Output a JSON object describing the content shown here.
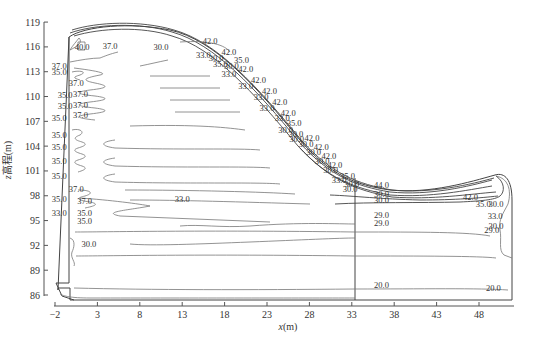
{
  "chart_data": {
    "type": "contour",
    "title": "",
    "xlabel": "x(m)",
    "ylabel": "z高程(m)",
    "xlim": [
      -2,
      51
    ],
    "ylim": [
      86,
      119
    ],
    "x_ticks": [
      "-2",
      "3",
      "8",
      "13",
      "18",
      "23",
      "28",
      "33",
      "38",
      "43",
      "48"
    ],
    "y_ticks": [
      "86",
      "89",
      "92",
      "95",
      "98",
      "101",
      "104",
      "107",
      "110",
      "113",
      "116",
      "119"
    ],
    "grid": false,
    "legend": null,
    "contour_labels": [
      {
        "x": 1.2,
        "z": 115.6,
        "value": "40.0"
      },
      {
        "x": 4.5,
        "z": 115.8,
        "value": "37.0"
      },
      {
        "x": 10.5,
        "z": 115.6,
        "value": "30.0"
      },
      {
        "x": 16.3,
        "z": 116.4,
        "value": "42.0"
      },
      {
        "x": 15.5,
        "z": 114.6,
        "value": "33.0"
      },
      {
        "x": 17.0,
        "z": 114.3,
        "value": "30.0"
      },
      {
        "x": 18.5,
        "z": 115.0,
        "value": "42.0"
      },
      {
        "x": 20.0,
        "z": 114.1,
        "value": "35.0"
      },
      {
        "x": 17.5,
        "z": 113.6,
        "value": "35.0"
      },
      {
        "x": 18.8,
        "z": 113.3,
        "value": "30.0"
      },
      {
        "x": 20.5,
        "z": 113.0,
        "value": "42.0"
      },
      {
        "x": 18.5,
        "z": 112.4,
        "value": "33.0"
      },
      {
        "x": 22.0,
        "z": 111.6,
        "value": "42.0"
      },
      {
        "x": 20.5,
        "z": 110.9,
        "value": "33.0"
      },
      {
        "x": 23.3,
        "z": 110.3,
        "value": "42.0"
      },
      {
        "x": 22.3,
        "z": 109.6,
        "value": "33.0"
      },
      {
        "x": 24.5,
        "z": 109.0,
        "value": "42.0"
      },
      {
        "x": 23.0,
        "z": 108.2,
        "value": "33.0"
      },
      {
        "x": 25.5,
        "z": 107.7,
        "value": "42.0"
      },
      {
        "x": 24.8,
        "z": 107.1,
        "value": "33.0"
      },
      {
        "x": 26.2,
        "z": 106.4,
        "value": "35.0"
      },
      {
        "x": 25.2,
        "z": 105.6,
        "value": "30.0"
      },
      {
        "x": 26.4,
        "z": 105.1,
        "value": "30.0"
      },
      {
        "x": 26.5,
        "z": 104.5,
        "value": "30.0"
      },
      {
        "x": 28.3,
        "z": 104.6,
        "value": "42.0"
      },
      {
        "x": 27.6,
        "z": 103.9,
        "value": "30.0"
      },
      {
        "x": 29.4,
        "z": 103.5,
        "value": "42.0"
      },
      {
        "x": 28.5,
        "z": 102.9,
        "value": "30.0"
      },
      {
        "x": 30.3,
        "z": 102.4,
        "value": "42.0"
      },
      {
        "x": 29.5,
        "z": 101.9,
        "value": "30.0"
      },
      {
        "x": 31.0,
        "z": 101.4,
        "value": "42.0"
      },
      {
        "x": 30.5,
        "z": 100.8,
        "value": "30.0"
      },
      {
        "x": 32.5,
        "z": 100.0,
        "value": "35.0"
      },
      {
        "x": 31.5,
        "z": 99.6,
        "value": "33.0"
      },
      {
        "x": 33.0,
        "z": 99.1,
        "value": "30.0"
      },
      {
        "x": 32.8,
        "z": 98.4,
        "value": "30.0"
      },
      {
        "x": 36.5,
        "z": 98.9,
        "value": "44.0"
      },
      {
        "x": 36.5,
        "z": 97.8,
        "value": "30.0"
      },
      {
        "x": 36.5,
        "z": 97.1,
        "value": "30.0"
      },
      {
        "x": 36.5,
        "z": 95.3,
        "value": "29.0"
      },
      {
        "x": 36.5,
        "z": 94.3,
        "value": "29.0"
      },
      {
        "x": 36.5,
        "z": 86.8,
        "value": "20.0"
      },
      {
        "x": 47.0,
        "z": 97.5,
        "value": "42.0"
      },
      {
        "x": 48.5,
        "z": 96.6,
        "value": "35.0"
      },
      {
        "x": 50.0,
        "z": 96.6,
        "value": "30.0"
      },
      {
        "x": 49.9,
        "z": 95.2,
        "value": "33.0"
      },
      {
        "x": 50.0,
        "z": 94.0,
        "value": "30.0"
      },
      {
        "x": 49.5,
        "z": 93.5,
        "value": "29.0"
      },
      {
        "x": 49.7,
        "z": 86.5,
        "value": "20.0"
      },
      {
        "x": -1.5,
        "z": 113.3,
        "value": "37.0"
      },
      {
        "x": -1.5,
        "z": 112.6,
        "value": "35.0"
      },
      {
        "x": 0.5,
        "z": 111.3,
        "value": "37.0"
      },
      {
        "x": 1.0,
        "z": 110.0,
        "value": "37.0"
      },
      {
        "x": -0.8,
        "z": 109.8,
        "value": "35.0"
      },
      {
        "x": 1.0,
        "z": 108.6,
        "value": "37.0"
      },
      {
        "x": -0.8,
        "z": 108.5,
        "value": "35.0"
      },
      {
        "x": 1.0,
        "z": 107.4,
        "value": "37.0"
      },
      {
        "x": -1.5,
        "z": 107.0,
        "value": "35.0"
      },
      {
        "x": -1.5,
        "z": 105.0,
        "value": "35.0"
      },
      {
        "x": -1.5,
        "z": 103.5,
        "value": "35.0"
      },
      {
        "x": -1.5,
        "z": 101.8,
        "value": "35.0"
      },
      {
        "x": -1.5,
        "z": 100.0,
        "value": "35.0"
      },
      {
        "x": 0.5,
        "z": 98.4,
        "value": "37.0"
      },
      {
        "x": -1.5,
        "z": 97.2,
        "value": "35.0"
      },
      {
        "x": 1.5,
        "z": 97.0,
        "value": "37.0"
      },
      {
        "x": 13.0,
        "z": 97.3,
        "value": "33.0"
      },
      {
        "x": -1.5,
        "z": 95.6,
        "value": "33.0"
      },
      {
        "x": 1.5,
        "z": 95.6,
        "value": "35.0"
      },
      {
        "x": 1.5,
        "z": 94.6,
        "value": "35.0"
      },
      {
        "x": 2.0,
        "z": 91.8,
        "value": "30.0"
      }
    ]
  },
  "axes": {
    "xlabel_prefix": "x",
    "xlabel_unit": "(m)",
    "ylabel_prefix": "z",
    "ylabel_text": "高程(m)"
  }
}
